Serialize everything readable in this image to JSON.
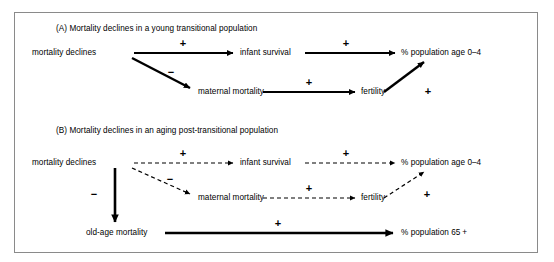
{
  "figure": {
    "background_color": "#ffffff",
    "frame_color": "#8a8a8a",
    "ink_color": "#000000"
  },
  "panels": [
    {
      "id": "panel-a",
      "title": "(A) Mortality declines in a young transitional population",
      "nodes": [
        {
          "id": "a-mortality-declines",
          "label": "mortality declines"
        },
        {
          "id": "a-infant-survival",
          "label": "infant survival"
        },
        {
          "id": "a-population-age-0-4",
          "label": "% population age 0–4"
        },
        {
          "id": "a-maternal-mortality",
          "label": "maternal mortality"
        },
        {
          "id": "a-fertility",
          "label": "fertility"
        }
      ],
      "edges": [
        {
          "id": "a-edge-1",
          "from": "mortality declines",
          "to": "infant survival",
          "sign": "+",
          "style": "solid"
        },
        {
          "id": "a-edge-2",
          "from": "infant survival",
          "to": "% population age 0–4",
          "sign": "+",
          "style": "solid"
        },
        {
          "id": "a-edge-3",
          "from": "mortality declines",
          "to": "maternal mortality",
          "sign": "−",
          "style": "solid"
        },
        {
          "id": "a-edge-4",
          "from": "maternal mortality",
          "to": "fertility",
          "sign": "+",
          "style": "solid"
        },
        {
          "id": "a-edge-5",
          "from": "fertility",
          "to": "% population age 0–4",
          "sign": "+",
          "style": "solid"
        }
      ]
    },
    {
      "id": "panel-b",
      "title": "(B) Mortality declines in an aging post-transitional population",
      "nodes": [
        {
          "id": "b-mortality-declines",
          "label": "mortality declines"
        },
        {
          "id": "b-infant-survival",
          "label": "infant survival"
        },
        {
          "id": "b-population-age-0-4",
          "label": "% population age 0–4"
        },
        {
          "id": "b-maternal-mortality",
          "label": "maternal mortality"
        },
        {
          "id": "b-fertility",
          "label": "fertility"
        },
        {
          "id": "b-old-age-mortality",
          "label": "old-age mortality"
        },
        {
          "id": "b-population-65-plus",
          "label": "% population 65 +"
        }
      ],
      "edges": [
        {
          "id": "b-edge-1",
          "from": "mortality declines",
          "to": "infant survival",
          "sign": "+",
          "style": "dashed"
        },
        {
          "id": "b-edge-2",
          "from": "infant survival",
          "to": "% population age 0–4",
          "sign": "+",
          "style": "dashed"
        },
        {
          "id": "b-edge-3",
          "from": "mortality declines",
          "to": "maternal mortality",
          "sign": "−",
          "style": "dashed"
        },
        {
          "id": "b-edge-4",
          "from": "maternal mortality",
          "to": "fertility",
          "sign": "+",
          "style": "dashed"
        },
        {
          "id": "b-edge-5",
          "from": "fertility",
          "to": "% population age 0–4",
          "sign": "+",
          "style": "dashed"
        },
        {
          "id": "b-edge-6",
          "from": "mortality declines",
          "to": "old-age mortality",
          "sign": "−",
          "style": "solid"
        },
        {
          "id": "b-edge-7",
          "from": "old-age mortality",
          "to": "% population 65 +",
          "sign": "+",
          "style": "solid"
        }
      ]
    }
  ]
}
